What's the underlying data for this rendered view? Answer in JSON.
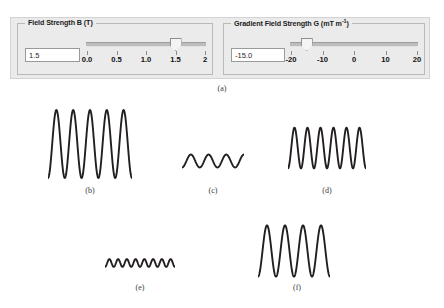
{
  "panel_a": {
    "caption": "(a)",
    "field_strength": {
      "title_main": "Field Strength B (T)",
      "title_text": "Field Strength B (T)",
      "value": "1.5",
      "placeholder": "1.5",
      "slider_min": 0,
      "slider_max": 2,
      "slider_value": 1.5,
      "ticks": [
        "0.0",
        "0.5",
        "1.0",
        "1.5",
        "2"
      ],
      "tick_values": [
        0,
        0.5,
        1.0,
        1.5,
        2
      ]
    },
    "gradient_field_strength": {
      "title_prefix": "Gradient Field Strength G (mT m",
      "title_sup": "-1",
      "title_suffix": ")",
      "value": "-15.0",
      "placeholder": "-15.0",
      "slider_min": -20,
      "slider_max": 20,
      "slider_value": -15,
      "ticks": [
        "-20",
        "-10",
        "0",
        "10",
        "20"
      ],
      "tick_values": [
        -20,
        -10,
        0,
        10,
        20
      ]
    }
  },
  "waveforms": [
    {
      "caption": "(b)",
      "amplitude": 1.0,
      "cycles": 5.0,
      "phase": 0.75
    },
    {
      "caption": "(c)",
      "amplitude": 0.34,
      "cycles": 3.5,
      "phase": 0.75
    },
    {
      "caption": "(d)",
      "amplitude": 0.7,
      "cycles": 6.0,
      "phase": 0.75
    },
    {
      "caption": "(e)",
      "amplitude": 0.3,
      "cycles": 8.0,
      "phase": 0.75
    },
    {
      "caption": "(f)",
      "amplitude": 0.95,
      "cycles": 4.0,
      "phase": 0.75
    }
  ],
  "chart_data": {
    "type": "line",
    "title": "",
    "xlabel": "",
    "ylabel": "",
    "panels": [
      {
        "label": "(b)",
        "amplitude": 1.0,
        "cycles": 5.0,
        "x": [
          0,
          1
        ],
        "description": "large amplitude sinusoid, five cycles"
      },
      {
        "label": "(c)",
        "amplitude": 0.34,
        "cycles": 3.5,
        "x": [
          0,
          1
        ],
        "description": "small amplitude sinusoid, three and a half cycles"
      },
      {
        "label": "(d)",
        "amplitude": 0.7,
        "cycles": 6.0,
        "x": [
          0,
          1
        ],
        "description": "medium amplitude sinusoid, six cycles"
      },
      {
        "label": "(e)",
        "amplitude": 0.3,
        "cycles": 8.0,
        "x": [
          0,
          1
        ],
        "description": "small amplitude sinusoid, eight cycles"
      },
      {
        "label": "(f)",
        "amplitude": 0.95,
        "cycles": 4.0,
        "x": [
          0,
          1
        ],
        "description": "large amplitude sinusoid, four cycles"
      }
    ],
    "grid": false,
    "legend": "none"
  },
  "colors": {
    "panel_background": "#ebebeb",
    "group_border": "#b9b9b9",
    "track": "#bdbdbd",
    "wave_stroke": "#231f20",
    "caption": "#3a3a3a"
  },
  "wave_layout": [
    {
      "left": 48,
      "top": 108,
      "width": 84,
      "height": 72,
      "cap_x": 90,
      "cap_y": 186
    },
    {
      "left": 182,
      "top": 140,
      "width": 62,
      "height": 42,
      "cap_x": 213,
      "cap_y": 186
    },
    {
      "left": 288,
      "top": 117,
      "width": 78,
      "height": 62,
      "cap_x": 327,
      "cap_y": 186
    },
    {
      "left": 105,
      "top": 248,
      "width": 70,
      "height": 30,
      "cap_x": 140,
      "cap_y": 283
    },
    {
      "left": 258,
      "top": 222,
      "width": 72,
      "height": 58,
      "cap_x": 297,
      "cap_y": 283
    }
  ]
}
